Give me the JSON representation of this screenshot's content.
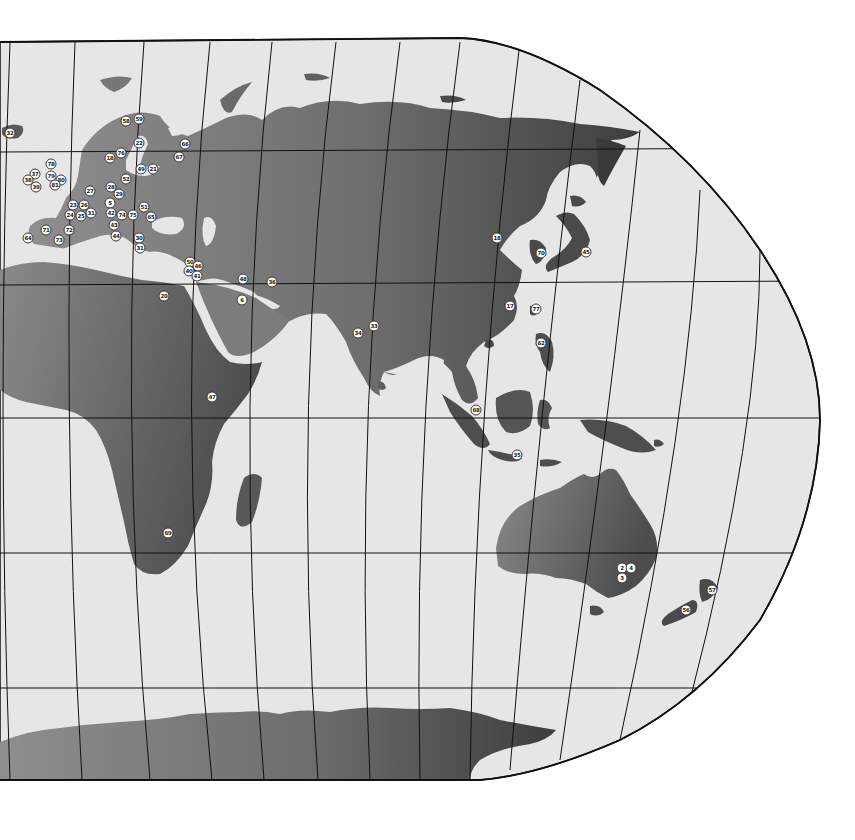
{
  "map": {
    "projection": "partial world map (eastern hemisphere), pseudo-cylindrical",
    "colors": {
      "ocean": "#e4e4e4",
      "land_light": "#8a8a8a",
      "land_dark": "#4a4a4a",
      "graticule": "#111111",
      "background": "#ffffff",
      "marker_fill": "#ffffff"
    },
    "regions_visible": [
      "Europe",
      "Africa",
      "Middle East",
      "Asia",
      "Southeast Asia",
      "Australia",
      "New Zealand",
      "Antarctica",
      "Greenland (edge)",
      "Iceland"
    ]
  },
  "markers": [
    {
      "label": "32",
      "x": 10,
      "y": 133
    },
    {
      "label": "58",
      "x": 126,
      "y": 121
    },
    {
      "label": "59",
      "x": 139,
      "y": 119
    },
    {
      "label": "22",
      "x": 139,
      "y": 143
    },
    {
      "label": "66",
      "x": 185,
      "y": 144
    },
    {
      "label": "67",
      "x": 179,
      "y": 157
    },
    {
      "label": "76",
      "x": 121,
      "y": 153
    },
    {
      "label": "18",
      "x": 110,
      "y": 158
    },
    {
      "label": "49",
      "x": 141,
      "y": 169
    },
    {
      "label": "21",
      "x": 153,
      "y": 169
    },
    {
      "label": "78",
      "x": 51,
      "y": 164
    },
    {
      "label": "37",
      "x": 35,
      "y": 174
    },
    {
      "label": "79",
      "x": 51,
      "y": 176
    },
    {
      "label": "38",
      "x": 28,
      "y": 180
    },
    {
      "label": "80",
      "x": 61,
      "y": 180
    },
    {
      "label": "39",
      "x": 36,
      "y": 187
    },
    {
      "label": "81",
      "x": 55,
      "y": 185
    },
    {
      "label": "52",
      "x": 126,
      "y": 179
    },
    {
      "label": "27",
      "x": 90,
      "y": 191
    },
    {
      "label": "28",
      "x": 111,
      "y": 187
    },
    {
      "label": "29",
      "x": 119,
      "y": 194
    },
    {
      "label": "5",
      "x": 110,
      "y": 203
    },
    {
      "label": "23",
      "x": 73,
      "y": 205
    },
    {
      "label": "26",
      "x": 84,
      "y": 205
    },
    {
      "label": "51",
      "x": 144,
      "y": 207
    },
    {
      "label": "24",
      "x": 70,
      "y": 215
    },
    {
      "label": "25",
      "x": 81,
      "y": 216
    },
    {
      "label": "31",
      "x": 91,
      "y": 213
    },
    {
      "label": "42",
      "x": 111,
      "y": 213
    },
    {
      "label": "74",
      "x": 122,
      "y": 215
    },
    {
      "label": "75",
      "x": 133,
      "y": 215
    },
    {
      "label": "65",
      "x": 151,
      "y": 217
    },
    {
      "label": "43",
      "x": 114,
      "y": 225
    },
    {
      "label": "71",
      "x": 46,
      "y": 230
    },
    {
      "label": "72",
      "x": 69,
      "y": 230
    },
    {
      "label": "44",
      "x": 116,
      "y": 236
    },
    {
      "label": "64",
      "x": 28,
      "y": 238
    },
    {
      "label": "73",
      "x": 59,
      "y": 240
    },
    {
      "label": "30",
      "x": 139,
      "y": 238
    },
    {
      "label": "31b",
      "text": "31",
      "x": 140,
      "y": 248
    },
    {
      "label": "50",
      "x": 190,
      "y": 262
    },
    {
      "label": "46",
      "x": 198,
      "y": 266
    },
    {
      "label": "40",
      "x": 189,
      "y": 271
    },
    {
      "label": "41",
      "x": 197,
      "y": 276
    },
    {
      "label": "48",
      "x": 243,
      "y": 279
    },
    {
      "label": "36",
      "x": 272,
      "y": 282
    },
    {
      "label": "20",
      "x": 164,
      "y": 296
    },
    {
      "label": "6",
      "x": 242,
      "y": 300
    },
    {
      "label": "34",
      "x": 358,
      "y": 333
    },
    {
      "label": "33",
      "x": 374,
      "y": 326
    },
    {
      "label": "18b",
      "text": "18",
      "x": 497,
      "y": 238
    },
    {
      "label": "70",
      "x": 541,
      "y": 253
    },
    {
      "label": "45",
      "x": 586,
      "y": 252
    },
    {
      "label": "17",
      "x": 510,
      "y": 306
    },
    {
      "label": "77",
      "x": 536,
      "y": 309
    },
    {
      "label": "62",
      "x": 541,
      "y": 343
    },
    {
      "label": "47",
      "x": 212,
      "y": 397
    },
    {
      "label": "68",
      "x": 476,
      "y": 410
    },
    {
      "label": "35",
      "x": 517,
      "y": 455
    },
    {
      "label": "69",
      "x": 168,
      "y": 533
    },
    {
      "label": "2",
      "x": 622,
      "y": 568
    },
    {
      "label": "4",
      "x": 631,
      "y": 568
    },
    {
      "label": "3",
      "x": 622,
      "y": 578
    },
    {
      "label": "57",
      "x": 712,
      "y": 590
    },
    {
      "label": "56",
      "x": 686,
      "y": 610
    }
  ]
}
